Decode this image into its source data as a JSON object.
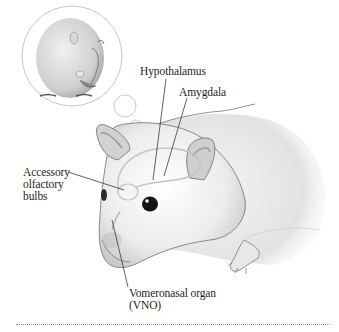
{
  "figure": {
    "labels": {
      "hypothalamus": "Hypothalamus",
      "amygdala": "Amygdala",
      "accessory_olfactory_bulbs": [
        "Accessory",
        "olfactory",
        "bulbs"
      ],
      "vno": [
        "Vomeronasal organ",
        "(VNO)"
      ]
    },
    "icons": {
      "thought_bubble": "thought-bubble-icon",
      "mouse": "mouse-illustration",
      "dreamed_mouse": "dreamed-mouse-illustration"
    },
    "colors": {
      "ink": "#231f20",
      "fur_light": "#f2f2f2",
      "fur_shadow": "#9a9a9a",
      "outline": "#6e6e6e",
      "leader_line": "#3a3a3a",
      "rule": "#8a8a8a"
    }
  }
}
